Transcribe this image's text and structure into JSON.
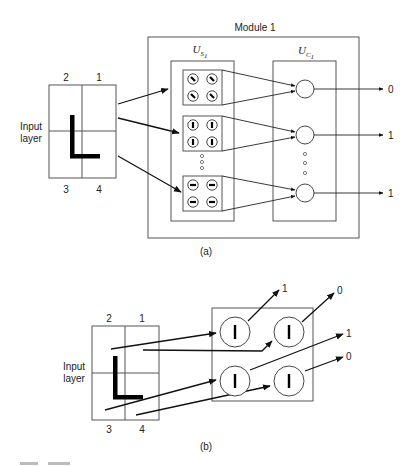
{
  "figure": {
    "part_a": {
      "caption": "(a)",
      "module_title": "Module 1",
      "input_layer": {
        "label_line1": "Input",
        "label_line2": "layer",
        "quadrant_labels": {
          "top_left": "2",
          "top_right": "1",
          "bottom_left": "3",
          "bottom_right": "4"
        },
        "pattern": "L"
      },
      "us_layer": {
        "label_main": "U",
        "label_sub": "S",
        "label_subsub": "1",
        "groups": [
          {
            "feature": "diagonal",
            "cells": 4
          },
          {
            "feature": "vertical",
            "cells": 4
          },
          {
            "feature": "horizontal",
            "cells": 4
          }
        ]
      },
      "uc_layer": {
        "label_main": "U",
        "label_sub": "C",
        "label_subsub": "1",
        "units": 3
      },
      "outputs": [
        "0",
        "1",
        "1"
      ]
    },
    "part_b": {
      "caption": "(b)",
      "input_layer": {
        "label_line1": "Input",
        "label_line2": "layer",
        "quadrant_labels": {
          "top_left": "2",
          "top_right": "1",
          "bottom_left": "3",
          "bottom_right": "4"
        },
        "pattern": "L"
      },
      "feature_cells": [
        {
          "position": "top-left",
          "feature": "vertical",
          "output": "1"
        },
        {
          "position": "top-right",
          "feature": "vertical",
          "output": "0"
        },
        {
          "position": "bottom-left",
          "feature": "vertical",
          "output": "1"
        },
        {
          "position": "bottom-right",
          "feature": "vertical",
          "output": "0"
        }
      ]
    }
  }
}
